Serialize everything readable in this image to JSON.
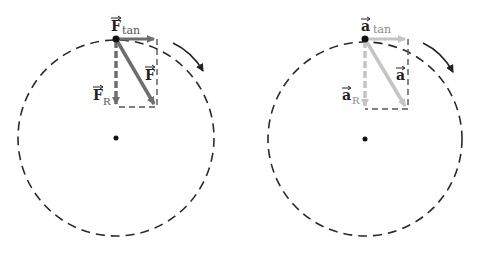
{
  "panels": [
    {
      "name": "force",
      "circle": {
        "cx": 116,
        "cy": 138,
        "r": 98
      },
      "center_dot": {
        "cx": 116,
        "cy": 138
      },
      "point": {
        "cx": 116,
        "cy": 39
      },
      "rect": {
        "x": 116,
        "y": 39,
        "w": 41,
        "h": 68
      },
      "vector_color": "#6e6e6e",
      "labels": {
        "tan": {
          "symbol": "F",
          "sub": "tan"
        },
        "radial": {
          "symbol": "F",
          "sub": "R"
        },
        "total": {
          "symbol": "F",
          "sub": ""
        }
      },
      "rotation_arrow": "clockwise"
    },
    {
      "name": "acceleration",
      "circle": {
        "cx": 365,
        "cy": 139,
        "r": 97
      },
      "center_dot": {
        "cx": 365,
        "cy": 139
      },
      "point": {
        "cx": 365,
        "cy": 39
      },
      "rect": {
        "x": 365,
        "y": 39,
        "w": 43,
        "h": 70
      },
      "vector_color": "#c4c4c4",
      "labels": {
        "tan": {
          "symbol": "a",
          "sub": "tan"
        },
        "radial": {
          "symbol": "a",
          "sub": "R"
        },
        "total": {
          "symbol": "a",
          "sub": ""
        }
      },
      "rotation_arrow": "clockwise"
    }
  ],
  "colors": {
    "dash": "#2a2a2a",
    "force_vector": "#6e6e6e",
    "accel_vector": "#c4c4c4",
    "label": "#222222",
    "sub_label_force": "#555555",
    "sub_label_accel": "#8a8a8a"
  }
}
